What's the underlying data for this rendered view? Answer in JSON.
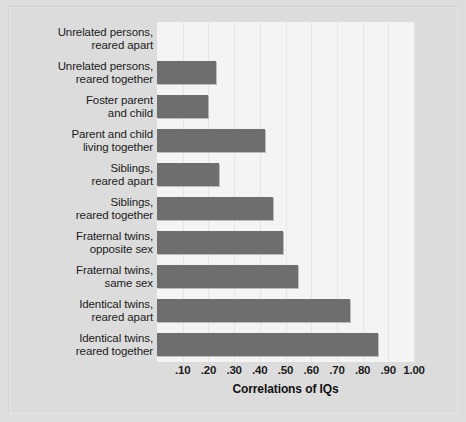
{
  "chart_data": {
    "type": "bar",
    "orientation": "horizontal",
    "title": "",
    "xlabel": "Correlations of IQs",
    "ylabel": "",
    "xlim": [
      0,
      1.0
    ],
    "grid": true,
    "legend": null,
    "tick_labels": [
      ".10",
      ".20",
      ".30",
      ".40",
      ".50",
      ".60",
      ".70",
      ".80",
      ".90",
      "1.00"
    ],
    "tick_values": [
      0.1,
      0.2,
      0.3,
      0.4,
      0.5,
      0.6,
      0.7,
      0.8,
      0.9,
      1.0
    ],
    "bar_color": "#6e6e6e",
    "plot_background": "#f4f4f4",
    "figure_background": "#dcdcdc",
    "categories": [
      "Unrelated persons, reared apart",
      "Unrelated persons, reared together",
      "Foster parent and child",
      "Parent and child living together",
      "Siblings, reared apart",
      "Siblings, reared together",
      "Fraternal twins, opposite sex",
      "Fraternal twins, same sex",
      "Identical twins, reared apart",
      "Identical twins, reared together"
    ],
    "values": [
      0.0,
      0.23,
      0.2,
      0.42,
      0.24,
      0.45,
      0.49,
      0.55,
      0.75,
      0.86
    ]
  },
  "categories_wrapped": [
    {
      "line1": "Unrelated persons,",
      "line2": "reared apart"
    },
    {
      "line1": "Unrelated persons,",
      "line2": "reared together"
    },
    {
      "line1": "Foster parent",
      "line2": "and child"
    },
    {
      "line1": "Parent and child",
      "line2": "living together"
    },
    {
      "line1": "Siblings,",
      "line2": "reared apart"
    },
    {
      "line1": "Siblings,",
      "line2": "reared together"
    },
    {
      "line1": "Fraternal twins,",
      "line2": "opposite sex"
    },
    {
      "line1": "Fraternal twins,",
      "line2": "same sex"
    },
    {
      "line1": "Identical twins,",
      "line2": "reared apart"
    },
    {
      "line1": "Identical twins,",
      "line2": "reared together"
    }
  ],
  "axis": {
    "title": "Correlations of IQs"
  }
}
